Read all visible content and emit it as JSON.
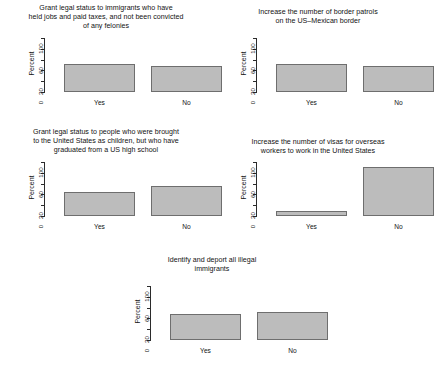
{
  "figure": {
    "background": "#ffffff",
    "bar_fill": "#bcbcbc",
    "bar_border": "#6e6e6e",
    "axis_color": "#2b2b2b"
  },
  "chart_data": [
    {
      "type": "bar",
      "title": "Grant legal status to immigrants who have\nheld jobs and paid taxes, and not been convicted\nof any felonies",
      "categories": [
        "Yes",
        "No"
      ],
      "values": [
        52,
        48
      ],
      "xlabel": "",
      "ylabel": "Percent",
      "ylim": [
        0,
        100
      ],
      "yticks": [
        0,
        20,
        40,
        60,
        80,
        100
      ],
      "ytick_labels": [
        "0",
        "20",
        "",
        "60",
        "",
        "100"
      ],
      "grid": false,
      "legend": "none"
    },
    {
      "type": "bar",
      "title": "Increase the number of border patrols\non the US–Mexican border",
      "categories": [
        "Yes",
        "No"
      ],
      "values": [
        52,
        48
      ],
      "xlabel": "",
      "ylabel": "Percent",
      "ylim": [
        0,
        100
      ],
      "yticks": [
        0,
        20,
        40,
        60,
        80,
        100
      ],
      "ytick_labels": [
        "0",
        "20",
        "",
        "60",
        "",
        "100"
      ],
      "grid": false,
      "legend": "none"
    },
    {
      "type": "bar",
      "title": "Grant legal status to people who were brought\nto the United States as children, but who have\ngraduated from a US high school",
      "categories": [
        "Yes",
        "No"
      ],
      "values": [
        45,
        55
      ],
      "xlabel": "",
      "ylabel": "Percent",
      "ylim": [
        0,
        100
      ],
      "yticks": [
        0,
        20,
        40,
        60,
        80,
        100
      ],
      "ytick_labels": [
        "0",
        "20",
        "",
        "60",
        "",
        "100"
      ],
      "grid": false,
      "legend": "none"
    },
    {
      "type": "bar",
      "title": "Increase the number of visas for overseas\nworkers to work in the United States",
      "categories": [
        "Yes",
        "No"
      ],
      "values": [
        10,
        90
      ],
      "xlabel": "",
      "ylabel": "Percent",
      "ylim": [
        0,
        100
      ],
      "yticks": [
        0,
        20,
        40,
        60,
        80,
        100
      ],
      "ytick_labels": [
        "0",
        "20",
        "",
        "60",
        "",
        "100"
      ],
      "grid": false,
      "legend": "none"
    },
    {
      "type": "bar",
      "title": "Identify and deport all illegal\nimmigrants",
      "categories": [
        "Yes",
        "No"
      ],
      "values": [
        48,
        52
      ],
      "xlabel": "",
      "ylabel": "Percent",
      "ylim": [
        0,
        100
      ],
      "yticks": [
        0,
        20,
        40,
        60,
        80,
        100
      ],
      "ytick_labels": [
        "0",
        "20",
        "",
        "60",
        "",
        "100"
      ],
      "grid": false,
      "legend": "none"
    }
  ]
}
